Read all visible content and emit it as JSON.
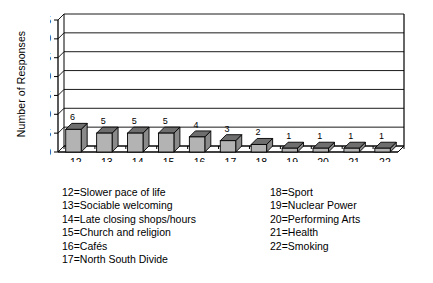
{
  "chart_data": {
    "type": "bar",
    "title": "",
    "xlabel": "",
    "ylabel": "Number of Responses",
    "categories": [
      "12",
      "13",
      "14",
      "15",
      "16",
      "17",
      "18",
      "19",
      "20",
      "21",
      "22"
    ],
    "values": [
      6,
      5,
      5,
      5,
      4,
      3,
      2,
      1,
      1,
      1,
      1
    ],
    "ylim": [
      0,
      35
    ],
    "ytick_labels": [
      "0",
      "5",
      "10",
      "15",
      "20",
      "25",
      "30",
      "35"
    ],
    "ytick_values": [
      0,
      5,
      10,
      15,
      20,
      25,
      30,
      35
    ],
    "grid": true,
    "legend_position": "below-plot",
    "style": "3d-column",
    "series_name": "Number of Responses",
    "bar_face_color": "#b3b3b3",
    "bar_top_color": "#6e6e6e",
    "bar_side_color": "#8a8a8a",
    "bar_outline_color": "#000000",
    "axis_color": "#000000",
    "grid_color": "#000000",
    "background_color": "#ffffff"
  },
  "legend": {
    "left_column": [
      "12=Slower pace of life",
      "13=Sociable welcoming",
      "14=Late closing shops/hours",
      "15=Church and religion",
      "16=Cafés",
      "17=North South Divide"
    ],
    "right_column": [
      "18=Sport",
      "19=Nuclear Power",
      "20=Performing Arts",
      "21=Health",
      "22=Smoking"
    ]
  }
}
